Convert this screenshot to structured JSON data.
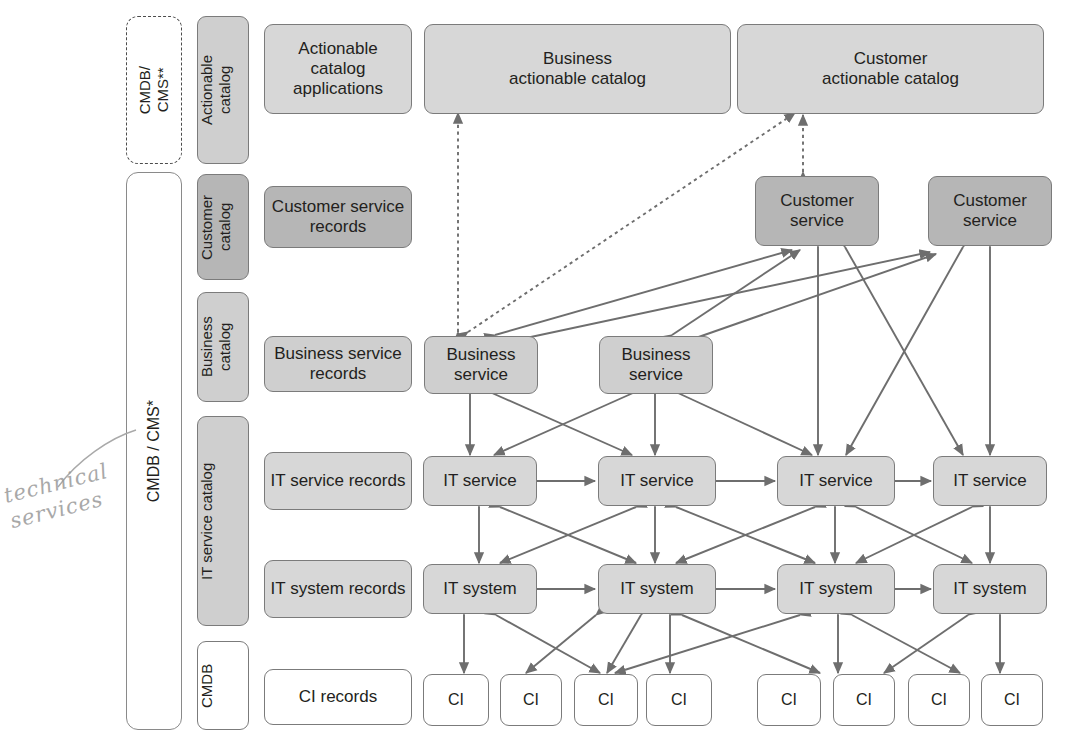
{
  "diagram": {
    "colors": {
      "stroke": "#7b7b7b",
      "arrow": "#6e6e6e",
      "fill_light": "#d7d7d7",
      "fill_mid": "#cfcfcf",
      "fill_dark": "#b6b6b6",
      "fill_white": "#ffffff",
      "text": "#231f20",
      "handwriting": "#9a9a9a"
    },
    "containers": [
      {
        "name": "cmdb-cms-double-star",
        "label": "CMDB/\nCMS**",
        "style": "dashed"
      },
      {
        "name": "cmdb-cms-single-star",
        "label": "CMDB / CMS*",
        "style": "solid"
      }
    ],
    "layers": [
      {
        "strip": "Actionable\ncatalog",
        "record": "Actionable catalog applications",
        "strip_fill": "mid",
        "record_fill": "light"
      },
      {
        "strip": "Customer\ncatalog",
        "record": "Customer service records",
        "strip_fill": "dark",
        "record_fill": "dark"
      },
      {
        "strip": "Business\ncatalog",
        "record": "Business service records",
        "strip_fill": "mid",
        "record_fill": "mid"
      },
      {
        "strip": "IT service catalog",
        "record": "IT service records",
        "strip_fill": "mid",
        "record_fill": "light"
      },
      {
        "strip": "IT service catalog",
        "record": "IT system records",
        "strip_fill": "mid",
        "record_fill": "light"
      },
      {
        "strip": "CMDB",
        "record": "CI records",
        "strip_fill": "white",
        "record_fill": "white"
      }
    ],
    "nodes": {
      "actionable_catalogs": [
        "Business\nactionable catalog",
        "Customer\nactionable catalog"
      ],
      "customer_services": [
        "Customer\nservice",
        "Customer\nservice"
      ],
      "business_services": [
        "Business\nservice",
        "Business\nservice"
      ],
      "it_services": [
        "IT service",
        "IT service",
        "IT service",
        "IT service"
      ],
      "it_systems": [
        "IT system",
        "IT system",
        "IT system",
        "IT system"
      ],
      "cis": [
        "CI",
        "CI",
        "CI",
        "CI",
        "CI",
        "CI",
        "CI",
        "CI"
      ]
    },
    "annotation": {
      "handwritten_note": "technical\nservices"
    }
  }
}
